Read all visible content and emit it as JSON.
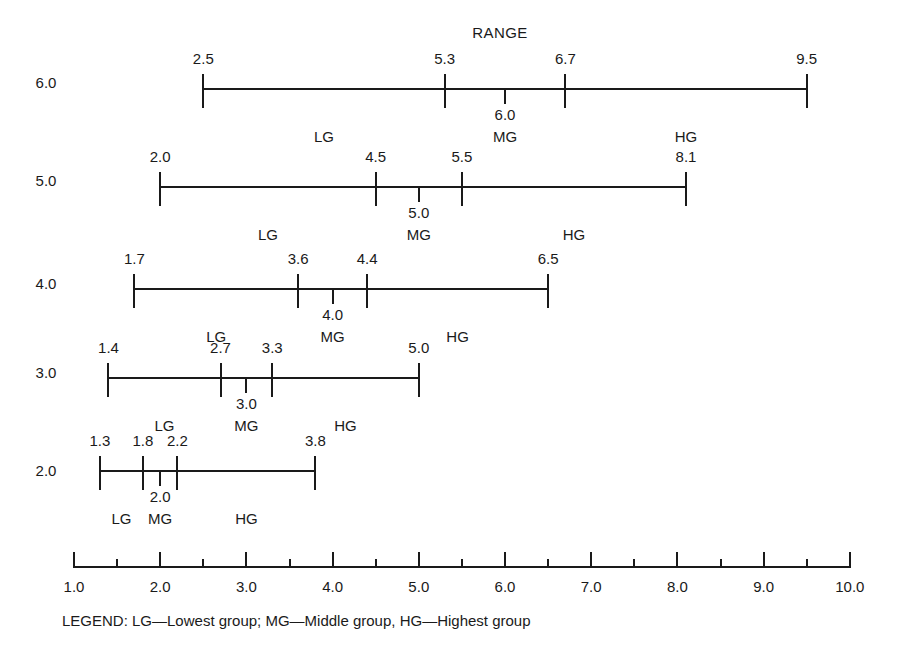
{
  "chart_data": {
    "type": "range",
    "title": "RANGE",
    "xlabel": "",
    "ylabel": "",
    "xlim": [
      1.0,
      10.0
    ],
    "grid": false,
    "legend_position": "below-axis",
    "legend_text": "LEGEND: LG—Lowest group; MG—Middle group, HG—Highest group",
    "legend_entries": [
      {
        "abbr": "LG",
        "meaning": "Lowest group"
      },
      {
        "abbr": "MG",
        "meaning": "Middle group"
      },
      {
        "abbr": "HG",
        "meaning": "Highest group"
      }
    ],
    "x_ticks_major": [
      "1.0",
      "2.0",
      "3.0",
      "4.0",
      "5.0",
      "6.0",
      "7.0",
      "8.0",
      "9.0",
      "10.0"
    ],
    "x_ticks_major_values": [
      1.0,
      2.0,
      3.0,
      4.0,
      5.0,
      6.0,
      7.0,
      8.0,
      9.0,
      10.0
    ],
    "x_ticks_minor_values": [
      1.5,
      2.5,
      3.5,
      4.5,
      5.5,
      6.5,
      7.5,
      8.5,
      9.5
    ],
    "rows": [
      {
        "row_label": "6.0",
        "range_min": 2.5,
        "range_max": 9.5,
        "lg_mg_boundary": 5.3,
        "mg_hg_boundary": 6.7,
        "mg_marker": 6.0,
        "mg_marker_label": "6.0",
        "endpoint_labels": [
          "2.5",
          "5.3",
          "6.7",
          "9.5"
        ],
        "group_labels": [
          "LG",
          "MG",
          "HG"
        ]
      },
      {
        "row_label": "5.0",
        "range_min": 2.0,
        "range_max": 8.1,
        "lg_mg_boundary": 4.5,
        "mg_hg_boundary": 5.5,
        "mg_marker": 5.0,
        "mg_marker_label": "5.0",
        "endpoint_labels": [
          "2.0",
          "4.5",
          "5.5",
          "8.1"
        ],
        "group_labels": [
          "LG",
          "MG",
          "HG"
        ]
      },
      {
        "row_label": "4.0",
        "range_min": 1.7,
        "range_max": 6.5,
        "lg_mg_boundary": 3.6,
        "mg_hg_boundary": 4.4,
        "mg_marker": 4.0,
        "mg_marker_label": "4.0",
        "endpoint_labels": [
          "1.7",
          "3.6",
          "4.4",
          "6.5"
        ],
        "group_labels": [
          "LG",
          "MG",
          "HG"
        ]
      },
      {
        "row_label": "3.0",
        "range_min": 1.4,
        "range_max": 5.0,
        "lg_mg_boundary": 2.7,
        "mg_hg_boundary": 3.3,
        "mg_marker": 3.0,
        "mg_marker_label": "3.0",
        "endpoint_labels": [
          "1.4",
          "2.7",
          "3.3",
          "5.0"
        ],
        "group_labels": [
          "LG",
          "MG",
          "HG"
        ]
      },
      {
        "row_label": "2.0",
        "range_min": 1.3,
        "range_max": 3.8,
        "lg_mg_boundary": 1.8,
        "mg_hg_boundary": 2.2,
        "mg_marker": 2.0,
        "mg_marker_label": "2.0",
        "endpoint_labels": [
          "1.3",
          "1.8",
          "2.2",
          "3.8"
        ],
        "group_labels": [
          "LG",
          "MG",
          "HG"
        ]
      }
    ]
  },
  "style": {
    "ink": "#1a1a1a",
    "paper": "#ffffff"
  }
}
